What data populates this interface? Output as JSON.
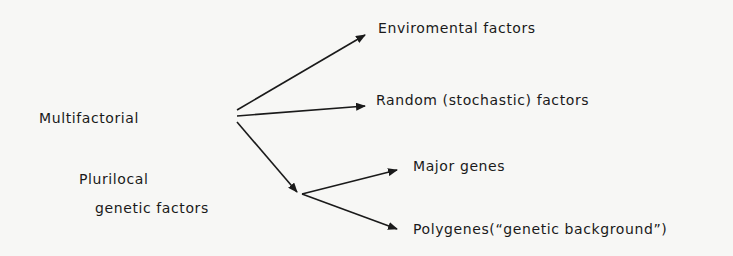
{
  "diagram": {
    "root": "Multifactorial",
    "subgroup": {
      "line1": "Plurilocal",
      "line2": "genetic factors"
    },
    "targets": {
      "environmental": "Enviromental factors",
      "random": "Random (stochastic) factors",
      "major_genes": "Major genes",
      "polygenes": "Polygenes(“genetic background”)"
    },
    "colors": {
      "ink": "#1a1a1a",
      "background": "#f7f7f5"
    }
  }
}
